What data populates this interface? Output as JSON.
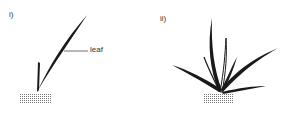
{
  "panels": [
    {
      "id": "i",
      "label": "i)",
      "annotation": "leaf"
    },
    {
      "id": "ii",
      "label": "ii)"
    }
  ],
  "colors": {
    "ink": "#1a1a1a",
    "soil": "#888888"
  }
}
